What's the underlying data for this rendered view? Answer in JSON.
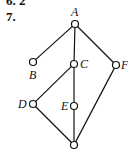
{
  "problem": {
    "previous_fragment": "6. 2",
    "number": "7."
  },
  "diagram": {
    "type": "hasse-diagram",
    "nodes": [
      {
        "id": "A",
        "label": "A",
        "x": 75,
        "y": 24,
        "lx": 71,
        "ly": 16
      },
      {
        "id": "B",
        "label": "B",
        "x": 33,
        "y": 62,
        "lx": 29,
        "ly": 79
      },
      {
        "id": "C",
        "label": "C",
        "x": 74,
        "y": 64,
        "lx": 80,
        "ly": 68
      },
      {
        "id": "F",
        "label": "F",
        "x": 116,
        "y": 65,
        "lx": 121,
        "ly": 69
      },
      {
        "id": "D",
        "label": "D",
        "x": 33,
        "y": 104,
        "lx": 18,
        "ly": 108
      },
      {
        "id": "E",
        "label": "E",
        "x": 74,
        "y": 106,
        "lx": 61,
        "ly": 110
      },
      {
        "id": "bottom",
        "label": "",
        "x": 74,
        "y": 145,
        "lx": 0,
        "ly": 0
      }
    ],
    "edges": [
      [
        "A",
        "B"
      ],
      [
        "A",
        "C"
      ],
      [
        "A",
        "F"
      ],
      [
        "C",
        "D"
      ],
      [
        "C",
        "E"
      ],
      [
        "D",
        "bottom"
      ],
      [
        "E",
        "bottom"
      ],
      [
        "F",
        "bottom"
      ]
    ]
  }
}
